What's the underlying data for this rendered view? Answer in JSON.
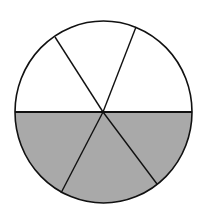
{
  "diagram": {
    "type": "fraction-circle",
    "total_parts": 6,
    "shaded_parts": 3,
    "colors": {
      "shaded": "#a9a9a9",
      "unshaded": "#ffffff",
      "stroke": "#111111"
    }
  }
}
